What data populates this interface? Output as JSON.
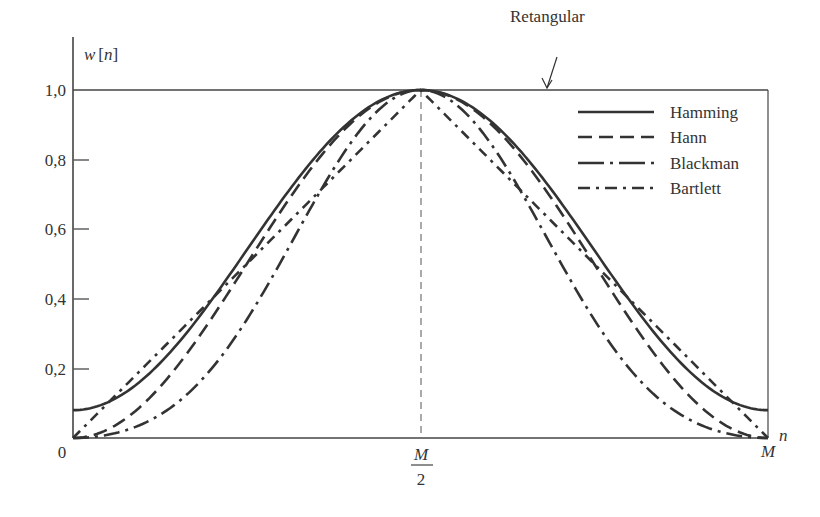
{
  "chart_data": {
    "type": "line",
    "title": "",
    "xlabel": "n",
    "ylabel": "w[n]",
    "xlim": [
      0,
      1
    ],
    "ylim": [
      0,
      1.0
    ],
    "x_ticks": [
      {
        "value": 0,
        "label": "0"
      },
      {
        "value": 0.5,
        "label": "M/2"
      },
      {
        "value": 1,
        "label": "M"
      }
    ],
    "y_ticks": [
      {
        "value": 0.2,
        "label": "0,2"
      },
      {
        "value": 0.4,
        "label": "0,4"
      },
      {
        "value": 0.6,
        "label": "0,6"
      },
      {
        "value": 0.8,
        "label": "0,8"
      },
      {
        "value": 1.0,
        "label": "1,0"
      }
    ],
    "grid": false,
    "legend_position": "upper right",
    "annotations": [
      {
        "text": "Retangular",
        "points_to": "top line at w[n]=1,0",
        "x": 0.68,
        "y": 1.0
      }
    ],
    "series": [
      {
        "name": "Retangular",
        "style": "solid-thin",
        "formula": "w[n]=1",
        "x": [
          0,
          1
        ],
        "values": [
          1.0,
          1.0
        ]
      },
      {
        "name": "Hamming",
        "style": "solid",
        "formula": "0.54-0.46cos(2πn/M)",
        "x": [
          0,
          0.1,
          0.2,
          0.3,
          0.4,
          0.5,
          0.6,
          0.7,
          0.8,
          0.9,
          1.0
        ],
        "values": [
          0.08,
          0.17,
          0.4,
          0.68,
          0.91,
          1.0,
          0.91,
          0.68,
          0.4,
          0.17,
          0.08
        ]
      },
      {
        "name": "Hann",
        "style": "dashed",
        "formula": "0.5-0.5cos(2πn/M)",
        "x": [
          0,
          0.1,
          0.2,
          0.3,
          0.4,
          0.5,
          0.6,
          0.7,
          0.8,
          0.9,
          1.0
        ],
        "values": [
          0.0,
          0.1,
          0.35,
          0.65,
          0.9,
          1.0,
          0.9,
          0.65,
          0.35,
          0.1,
          0.0
        ]
      },
      {
        "name": "Blackman",
        "style": "long-dash-dot",
        "formula": "0.42-0.5cos(2πn/M)+0.08cos(4πn/M)",
        "x": [
          0,
          0.1,
          0.2,
          0.3,
          0.4,
          0.5,
          0.6,
          0.7,
          0.8,
          0.9,
          1.0
        ],
        "values": [
          0.0,
          0.04,
          0.2,
          0.51,
          0.85,
          1.0,
          0.85,
          0.51,
          0.2,
          0.04,
          0.0
        ]
      },
      {
        "name": "Bartlett",
        "style": "dash-dot",
        "formula": "triangular",
        "x": [
          0,
          0.5,
          1.0
        ],
        "values": [
          0.0,
          1.0,
          0.0
        ]
      }
    ]
  },
  "labels": {
    "ylabel_w": "w",
    "ylabel_bracket_open": "[",
    "ylabel_n": "n",
    "ylabel_bracket_close": "]",
    "xlabel": "n",
    "origin": "0",
    "x_mid_num": "M",
    "x_mid_den": "2",
    "x_end": "M",
    "y_1_0": "1,0",
    "y_0_8": "0,8",
    "y_0_6": "0,6",
    "y_0_4": "0,4",
    "y_0_2": "0,2",
    "rect_annotation": "Retangular"
  },
  "legend": {
    "items": [
      {
        "label": "Hamming"
      },
      {
        "label": "Hann"
      },
      {
        "label": "Blackman"
      },
      {
        "label": "Bartlett"
      }
    ]
  },
  "colors": {
    "ink": "#333333",
    "background": "#ffffff"
  }
}
